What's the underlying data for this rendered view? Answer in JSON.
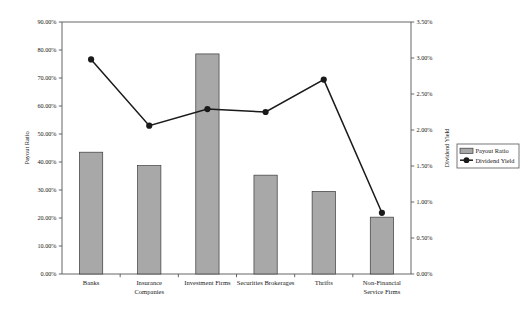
{
  "chart_data": {
    "type": "bar",
    "title": "",
    "subtitle": "",
    "xlabel": "",
    "ylabel": "Payout Ratio",
    "y2label": "Dividend Yield",
    "categories": [
      "Banks",
      "Insurance Companies",
      "Investment Firms",
      "Securities Brokerages",
      "Thrifts",
      "Non-Financial Service Firms"
    ],
    "category_lines": [
      [
        "Banks"
      ],
      [
        "Insurance",
        "Companies"
      ],
      [
        "Investment Firms"
      ],
      [
        "Securities Brokerages"
      ],
      [
        "Thrifts"
      ],
      [
        "Non-Financial",
        "Service Firms"
      ]
    ],
    "series": [
      {
        "name": "Payout Ratio",
        "type": "bar",
        "axis": "left",
        "color": "#a8a8a8",
        "values": [
          43.5,
          38.7,
          78.6,
          35.3,
          29.5,
          20.3
        ]
      },
      {
        "name": "Dividend Yield",
        "type": "line",
        "axis": "right",
        "color": "#1a1a1a",
        "values": [
          2.98,
          2.06,
          2.29,
          2.25,
          2.7,
          0.85
        ]
      }
    ],
    "ylim": [
      0,
      90
    ],
    "y2lim": [
      0,
      3.5
    ],
    "yticks": [
      "0.00%",
      "10.00%",
      "20.00%",
      "30.00%",
      "40.00%",
      "50.00%",
      "60.00%",
      "70.00%",
      "80.00%",
      "90.00%"
    ],
    "ytick_values": [
      0,
      10,
      20,
      30,
      40,
      50,
      60,
      70,
      80,
      90
    ],
    "y2ticks": [
      "0.00%",
      "0.50%",
      "1.00%",
      "1.50%",
      "2.00%",
      "2.50%",
      "3.00%",
      "3.50%"
    ],
    "y2tick_values": [
      0,
      0.5,
      1.0,
      1.5,
      2.0,
      2.5,
      3.0,
      3.5
    ],
    "grid": false,
    "legend_position": "right",
    "legend": [
      {
        "label": "Payout Ratio",
        "marker": "bar-swatch",
        "color": "#a8a8a8"
      },
      {
        "label": "Dividend Yield",
        "marker": "line-dot",
        "color": "#1a1a1a"
      }
    ]
  },
  "caption": {
    "text": ""
  }
}
